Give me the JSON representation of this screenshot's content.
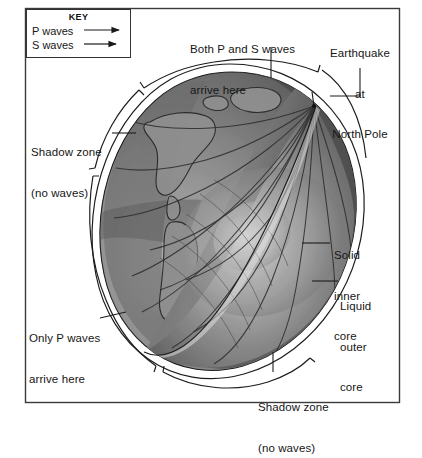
{
  "figure": {
    "frame_color": "#3a3a3a",
    "background": "#ffffff"
  },
  "key": {
    "title": "KEY",
    "entries": [
      {
        "label": "P waves",
        "icon": "arrow-right-icon",
        "style": "solid-arrow"
      },
      {
        "label": "S waves",
        "icon": "arrow-right-icon",
        "style": "solid-arrow"
      }
    ]
  },
  "labels": {
    "both_waves": {
      "line1": "Both P and S waves",
      "line2": "arrive here"
    },
    "earthquake": {
      "line1": "Earthquake",
      "line2": "at",
      "line3": "North Pole"
    },
    "shadow_zone_left": {
      "line1": "Shadow zone",
      "line2": "(no waves)"
    },
    "shadow_zone_bottom": {
      "line1": "Shadow zone",
      "line2": "(no waves)"
    },
    "only_p_waves": {
      "line1": "Only P waves",
      "line2": "arrive here"
    },
    "inner_core": {
      "line1": "Solid",
      "line2": "inner",
      "line3": "core"
    },
    "outer_core": {
      "line1": "Liquid",
      "line2": "outer",
      "line3": "core"
    }
  },
  "diagram_data": {
    "type": "cutaway-cross-section",
    "source": "Earthquake at North Pole",
    "earth_layers": [
      "crust and mantle",
      "liquid outer core",
      "solid inner core"
    ],
    "zones": [
      {
        "name": "Both P and S waves arrive here",
        "position": "top"
      },
      {
        "name": "Shadow zone (no waves)",
        "position": "upper-left"
      },
      {
        "name": "Only P waves arrive here",
        "position": "lower-left"
      },
      {
        "name": "Shadow zone (no waves)",
        "position": "bottom"
      }
    ],
    "shading": {
      "surface_light": "#9a9a9a",
      "surface_dark": "#5e5e5e",
      "cut_face_light": "#c9c9c9",
      "cut_face_mid": "#8d8d8d",
      "cut_face_dark": "#4a4a4a",
      "ray_color": "#2f2f2f",
      "outline": "#1d1d1d"
    }
  }
}
